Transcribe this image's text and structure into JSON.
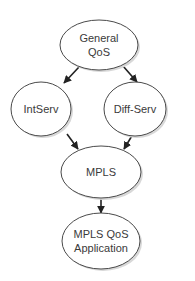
{
  "diagram": {
    "type": "flowchart",
    "nodes": [
      {
        "id": "general_qos",
        "lines": [
          "General",
          "QoS"
        ]
      },
      {
        "id": "intserv",
        "lines": [
          "IntServ"
        ]
      },
      {
        "id": "diffserv",
        "lines": [
          "Diff-Serv"
        ]
      },
      {
        "id": "mpls",
        "lines": [
          "MPLS"
        ]
      },
      {
        "id": "mpls_qos_app",
        "lines": [
          "MPLS QoS",
          "Application"
        ]
      }
    ],
    "edges": [
      {
        "from": "general_qos",
        "to": "intserv"
      },
      {
        "from": "general_qos",
        "to": "diffserv"
      },
      {
        "from": "intserv",
        "to": "mpls"
      },
      {
        "from": "diffserv",
        "to": "mpls"
      },
      {
        "from": "mpls",
        "to": "mpls_qos_app"
      }
    ]
  }
}
